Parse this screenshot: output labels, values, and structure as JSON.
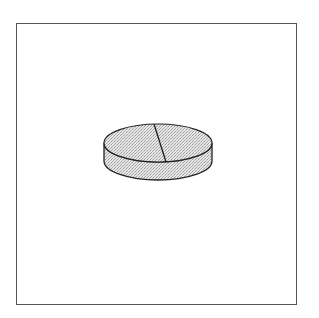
{
  "figure": {
    "colors": {
      "line": "#222222",
      "fill": "#d8d8d8",
      "frame": "#555555",
      "background": "#ffffff"
    }
  }
}
